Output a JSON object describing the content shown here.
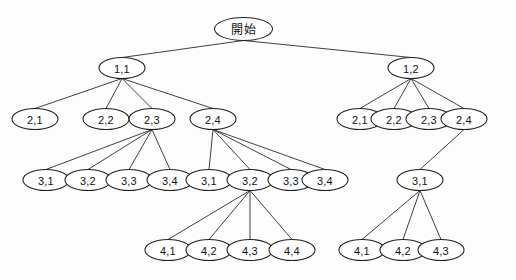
{
  "figure": {
    "kind": "tree-diagram",
    "background_color": "#fdfdfd",
    "line_color": "#2b2b2b",
    "node_fill": "#ffffff",
    "node_stroke": "#1f1f1f"
  },
  "nodes": [
    {
      "id": "root",
      "label": "開始",
      "cx": 243.5,
      "cy": 29,
      "rx": 29,
      "ry": 11.5,
      "is_root": true
    },
    {
      "id": "n11",
      "label": "1,1",
      "cx": 122,
      "cy": 68,
      "rx": 23,
      "ry": 10.5
    },
    {
      "id": "n12",
      "label": "1,2",
      "cx": 411,
      "cy": 68,
      "rx": 23,
      "ry": 10.5
    },
    {
      "id": "L21",
      "label": "2,1",
      "cx": 35,
      "cy": 119,
      "rx": 23,
      "ry": 10.5
    },
    {
      "id": "L22",
      "label": "2,2",
      "cx": 106,
      "cy": 119,
      "rx": 23,
      "ry": 10.5
    },
    {
      "id": "L23",
      "label": "2,3",
      "cx": 152,
      "cy": 119,
      "rx": 23,
      "ry": 10.5
    },
    {
      "id": "L24",
      "label": "2,4",
      "cx": 213,
      "cy": 119,
      "rx": 23,
      "ry": 10.5
    },
    {
      "id": "R21",
      "label": "2,1",
      "cx": 360,
      "cy": 119,
      "rx": 23,
      "ry": 10.5
    },
    {
      "id": "R22",
      "label": "2,2",
      "cx": 394,
      "cy": 119,
      "rx": 23,
      "ry": 10.5
    },
    {
      "id": "R23",
      "label": "2,3",
      "cx": 429,
      "cy": 119,
      "rx": 23,
      "ry": 10.5
    },
    {
      "id": "R24",
      "label": "2,4",
      "cx": 464,
      "cy": 119,
      "rx": 23,
      "ry": 10.5
    },
    {
      "id": "A31",
      "label": "3,1",
      "cx": 46,
      "cy": 180,
      "rx": 23,
      "ry": 10.5
    },
    {
      "id": "A32",
      "label": "3,2",
      "cx": 88,
      "cy": 180,
      "rx": 23,
      "ry": 10.5
    },
    {
      "id": "A33",
      "label": "3,3",
      "cx": 129,
      "cy": 180,
      "rx": 23,
      "ry": 10.5
    },
    {
      "id": "A34",
      "label": "3,4",
      "cx": 170,
      "cy": 180,
      "rx": 23,
      "ry": 10.5
    },
    {
      "id": "B31",
      "label": "3,1",
      "cx": 209,
      "cy": 180,
      "rx": 23,
      "ry": 10.5
    },
    {
      "id": "B32",
      "label": "3,2",
      "cx": 250,
      "cy": 180,
      "rx": 23,
      "ry": 10.5
    },
    {
      "id": "B33",
      "label": "3,3",
      "cx": 291,
      "cy": 180,
      "rx": 23,
      "ry": 10.5
    },
    {
      "id": "B34",
      "label": "3,4",
      "cx": 325,
      "cy": 180,
      "rx": 23,
      "ry": 10.5
    },
    {
      "id": "R31",
      "label": "3,1",
      "cx": 420,
      "cy": 180,
      "rx": 23,
      "ry": 10.5
    },
    {
      "id": "C41",
      "label": "4,1",
      "cx": 168,
      "cy": 250,
      "rx": 23,
      "ry": 10.5
    },
    {
      "id": "C42",
      "label": "4,2",
      "cx": 209,
      "cy": 250,
      "rx": 23,
      "ry": 10.5
    },
    {
      "id": "C43",
      "label": "4,3",
      "cx": 250,
      "cy": 250,
      "rx": 23,
      "ry": 10.5
    },
    {
      "id": "C44",
      "label": "4,4",
      "cx": 292,
      "cy": 250,
      "rx": 23,
      "ry": 10.5
    },
    {
      "id": "D41",
      "label": "4,1",
      "cx": 362,
      "cy": 250,
      "rx": 23,
      "ry": 10.5
    },
    {
      "id": "D42",
      "label": "4,2",
      "cx": 403,
      "cy": 250,
      "rx": 23,
      "ry": 10.5
    },
    {
      "id": "D43",
      "label": "4,3",
      "cx": 441,
      "cy": 250,
      "rx": 23,
      "ry": 10.5
    }
  ],
  "edges": [
    {
      "from": "root",
      "to": "n11"
    },
    {
      "from": "root",
      "to": "n12"
    },
    {
      "from": "n11",
      "to": "L21"
    },
    {
      "from": "n11",
      "to": "L22"
    },
    {
      "from": "n11",
      "to": "L23"
    },
    {
      "from": "n11",
      "to": "L24"
    },
    {
      "from": "n12",
      "to": "R21"
    },
    {
      "from": "n12",
      "to": "R22"
    },
    {
      "from": "n12",
      "to": "R23"
    },
    {
      "from": "n12",
      "to": "R24"
    },
    {
      "from": "L23",
      "to": "A31"
    },
    {
      "from": "L23",
      "to": "A32"
    },
    {
      "from": "L23",
      "to": "A33"
    },
    {
      "from": "L23",
      "to": "A34"
    },
    {
      "from": "L24",
      "to": "B31"
    },
    {
      "from": "L24",
      "to": "B32"
    },
    {
      "from": "L24",
      "to": "B33"
    },
    {
      "from": "L24",
      "to": "B34"
    },
    {
      "from": "R24",
      "to": "R31"
    },
    {
      "from": "B32",
      "to": "C41"
    },
    {
      "from": "B32",
      "to": "C42"
    },
    {
      "from": "B32",
      "to": "C43"
    },
    {
      "from": "B32",
      "to": "C44"
    },
    {
      "from": "R31",
      "to": "D41"
    },
    {
      "from": "R31",
      "to": "D42"
    },
    {
      "from": "R31",
      "to": "D43"
    }
  ]
}
